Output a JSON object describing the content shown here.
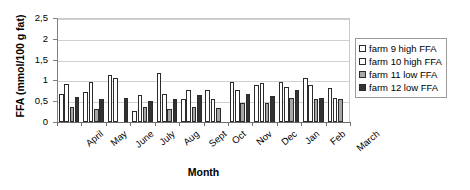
{
  "chart_data": {
    "type": "bar",
    "title": "",
    "xlabel": "Month",
    "ylabel": "FFA (mmol/100 g fat)",
    "ylim": [
      0,
      2.5
    ],
    "ytick_labels": [
      "0",
      "0,5",
      "1",
      "1,5",
      "2",
      "2,5"
    ],
    "ytick_values": [
      0,
      0.5,
      1,
      1.5,
      2,
      2.5
    ],
    "grid": true,
    "legend_position": "right",
    "categories": [
      "April",
      "May",
      "June",
      "July",
      "Aug",
      "Sept",
      "Oct",
      "Nov",
      "Dec",
      "Jan",
      "Feb",
      "March"
    ],
    "series": [
      {
        "name": "farm 9 high FFA",
        "pattern": "white",
        "values": [
          0.68,
          0.73,
          1.13,
          0.27,
          1.18,
          0.55,
          0.78,
          0.97,
          0.88,
          0.95,
          1.05,
          0.82
        ]
      },
      {
        "name": "farm 10 high FFA",
        "pattern": "dotted",
        "values": [
          0.92,
          0.96,
          1.07,
          0.66,
          0.67,
          0.78,
          0.56,
          0.76,
          0.93,
          0.83,
          0.88,
          0.58
        ]
      },
      {
        "name": "farm 11 low FFA",
        "pattern": "gray",
        "values": [
          0.37,
          0.31,
          0.0,
          0.37,
          0.32,
          0.35,
          0.34,
          0.45,
          0.46,
          0.57,
          0.56,
          0.56
        ]
      },
      {
        "name": "farm 12 low FFA",
        "pattern": "dark",
        "values": [
          0.6,
          0.56,
          0.57,
          0.51,
          0.55,
          0.66,
          0.0,
          0.68,
          0.62,
          0.77,
          0.57,
          0.0
        ]
      }
    ]
  },
  "legend": {
    "items": [
      {
        "label": "farm 9 high FFA"
      },
      {
        "label": "farm 10 high FFA"
      },
      {
        "label": "farm 11 low FFA"
      },
      {
        "label": "farm 12 low FFA"
      }
    ]
  },
  "colors": {
    "series_0": "#ffffff",
    "series_1": "#ffffff",
    "series_2": "#a6a6a6",
    "series_3": "#333333",
    "bar_outline": "#2b2b2b",
    "axis": "#808080",
    "gridline": "#d0d0d0",
    "text": "#000000"
  }
}
